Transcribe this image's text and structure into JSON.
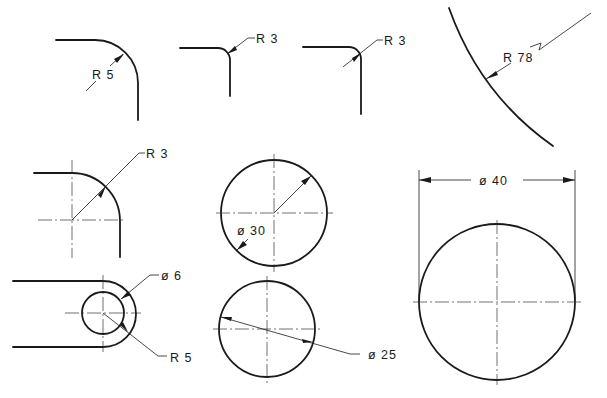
{
  "drawing": {
    "colors": {
      "line": "#1a1a1a",
      "background": "#ffffff"
    },
    "dimensions": [
      {
        "id": "fillet-r5-top",
        "label": "R 5"
      },
      {
        "id": "fillet-r3-top-a",
        "label": "R 3"
      },
      {
        "id": "fillet-r3-top-b",
        "label": "R 3"
      },
      {
        "id": "arc-r78",
        "label": "R 78"
      },
      {
        "id": "fillet-r3-mid",
        "label": "R 3"
      },
      {
        "id": "circle-d30",
        "label": "ø 30"
      },
      {
        "id": "slot-hole-d6",
        "label": "ø 6"
      },
      {
        "id": "slot-end-r5",
        "label": "R 5"
      },
      {
        "id": "circle-d25",
        "label": "ø 25"
      },
      {
        "id": "circle-d40",
        "label": "ø 40"
      }
    ]
  }
}
